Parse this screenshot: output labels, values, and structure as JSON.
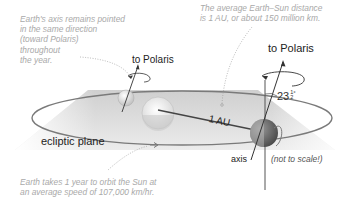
{
  "annotations": {
    "axis_note": "Earth's axis remains pointed\nin the same direction\n(toward Polaris)\nthroughout\nthe year.",
    "distance_note": "The average Earth–Sun distance\nis 1 AU, or about 150 million km.",
    "orbit_note": "Earth takes 1 year to orbit the Sun at\nan average speed of 107,000 km/hr."
  },
  "labels": {
    "to_polaris_left": "to Polaris",
    "to_polaris_right": "to Polaris",
    "ecliptic_plane": "ecliptic plane",
    "distance": "1 AU",
    "axis": "axis",
    "tilt_whole": "23",
    "tilt_num": "1",
    "tilt_den": "2",
    "tilt_deg": "°",
    "not_to_scale": "(not to scale!)"
  },
  "colors": {
    "plane": "#d8d8d8",
    "orbit": "#7a7a7a",
    "earth_dark": "#6e6e6e",
    "sun": "#e6e6e6",
    "note_text": "#a9a9a9"
  }
}
